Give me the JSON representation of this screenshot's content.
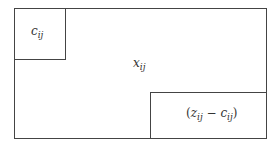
{
  "diagram": {
    "outer_label": "xᵢⱼ",
    "outer_text": "x",
    "outer_sub": "ij",
    "top_left_label_main": "c",
    "top_left_label_sub": "ij",
    "bottom_right_label": "(zᵢⱼ − cᵢⱼ)",
    "br_open": "(",
    "br_z": "z",
    "br_sub1": "ij",
    "br_minus": " − ",
    "br_c": "c",
    "br_sub2": "ij",
    "br_close": ")"
  }
}
